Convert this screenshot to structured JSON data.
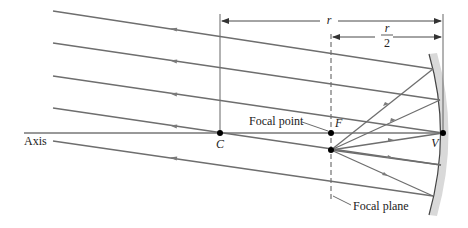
{
  "diagram": {
    "labels": {
      "axis": "Axis",
      "center": "C",
      "focus": "F",
      "vertex": "V",
      "focal_point": "Focal point",
      "focal_plane": "Focal plane",
      "radius": "r",
      "half_radius_num": "r",
      "half_radius_den": "2"
    },
    "colors": {
      "ray": "#6e6e6e",
      "axis": "#333333",
      "mirror_line": "#444444",
      "mirror_shade": "#d6d6d6",
      "point": "#000000",
      "dimension": "#333333"
    },
    "points": {
      "C": {
        "x": 220,
        "y": 133
      },
      "F": {
        "x": 331,
        "y": 133
      },
      "focal_plane_point": {
        "x": 331,
        "y": 150
      },
      "V": {
        "x": 443,
        "y": 133
      }
    },
    "incident_rays": [
      {
        "from": [
          53,
          11
        ],
        "to": [
          433,
          69
        ]
      },
      {
        "from": [
          53,
          43
        ],
        "to": [
          440,
          100
        ]
      },
      {
        "from": [
          53,
          76
        ],
        "to": [
          443,
          133
        ]
      },
      {
        "from": [
          53,
          108
        ],
        "to": [
          441,
          165
        ]
      },
      {
        "from": [
          53,
          141
        ],
        "to": [
          433,
          196
        ]
      }
    ],
    "reflected_rays": [
      {
        "from": [
          433,
          69
        ],
        "to": [
          331,
          150
        ]
      },
      {
        "from": [
          440,
          100
        ],
        "to": [
          331,
          150
        ]
      },
      {
        "from": [
          443,
          133
        ],
        "to": [
          331,
          150
        ]
      },
      {
        "from": [
          441,
          165
        ],
        "to": [
          331,
          150
        ]
      },
      {
        "from": [
          433,
          196
        ],
        "to": [
          331,
          150
        ]
      }
    ]
  }
}
